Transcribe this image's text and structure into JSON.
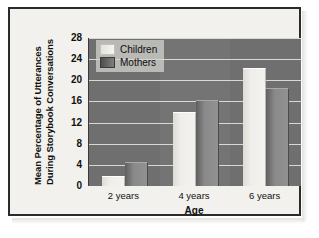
{
  "chart_data": {
    "type": "bar",
    "title": "",
    "xlabel": "Age",
    "ylabel_line1": "Mean Percentage of Utterances",
    "ylabel_line2": "During Storybook Conversations",
    "categories": [
      "2 years",
      "4 years",
      "6 years"
    ],
    "series": [
      {
        "name": "Children",
        "values": [
          1.7,
          13.9,
          22.2
        ],
        "color": "#f0efeb"
      },
      {
        "name": "Mothers",
        "values": [
          4.3,
          16.0,
          18.3
        ],
        "color": "#8a8a8a"
      }
    ],
    "ylim": [
      0,
      28
    ],
    "yticks": [
      0,
      4,
      8,
      12,
      16,
      20,
      24,
      28
    ],
    "ytick_labels": [
      "0",
      "4",
      "8",
      "12",
      "16",
      "20",
      "24",
      "28"
    ],
    "grid": true,
    "legend_position": "top-left",
    "plot_background": "#6f6f6f",
    "gridline_color": "#d8d8d4",
    "frame_color": "#2b2b2b",
    "page_background": "#f2f1ee"
  }
}
